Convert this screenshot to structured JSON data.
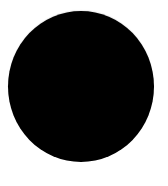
{
  "canvas": {
    "background_color": "#ffffff"
  },
  "shape": {
    "type": "circle",
    "fill_color": "#000000",
    "icon": "filled-circle-icon"
  }
}
